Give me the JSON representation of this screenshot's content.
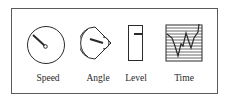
{
  "diagram": {
    "items": [
      {
        "label": "Speed",
        "icon": "dial-gauge-icon"
      },
      {
        "label": "Angle",
        "icon": "sector-gauge-icon"
      },
      {
        "label": "Level",
        "icon": "vertical-level-gauge-icon"
      },
      {
        "label": "Time",
        "icon": "time-series-chart-icon"
      }
    ]
  },
  "colors": {
    "stroke": "#2a2a2a",
    "border": "#5a5a5a",
    "background": "#ffffff"
  }
}
